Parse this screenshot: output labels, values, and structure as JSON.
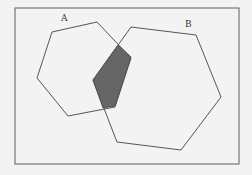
{
  "diagram": {
    "type": "venn-polygons",
    "background": "#f3f3f3",
    "frame": {
      "x": 15,
      "y": 8,
      "width": 224,
      "height": 156,
      "stroke": "#777777"
    },
    "shapes": [
      {
        "id": "A",
        "label": "A",
        "label_pos": [
          61,
          21
        ],
        "points": "52,32 97,22 131,58 115,107 68,116 37,78",
        "stroke": "#555555"
      },
      {
        "id": "B",
        "label": "B",
        "label_pos": [
          185,
          27
        ],
        "points": "131,27 196,35 221,97 181,150 117,142 93,80",
        "stroke": "#555555"
      }
    ],
    "intersection": {
      "label": "A ∩ B",
      "points": "118,45 131,57 115,106 103,108 93,80",
      "fill": "#666666"
    }
  }
}
